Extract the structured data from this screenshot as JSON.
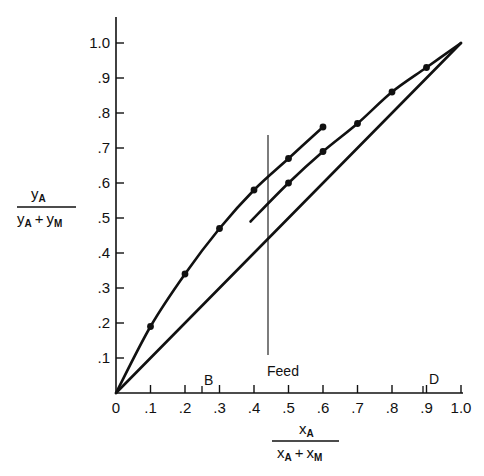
{
  "chart_data": {
    "type": "line",
    "title": "",
    "xlabel": "x_A / (x_A + x_M)",
    "ylabel": "y_A / (y_A + y_M)",
    "xlim": [
      0,
      1.0
    ],
    "ylim": [
      0,
      1.0
    ],
    "grid": false,
    "x_ticks": [
      "0",
      ".1",
      ".2",
      ".3",
      ".4",
      ".5",
      ".6",
      ".7",
      ".8",
      ".9",
      "1.0"
    ],
    "y_ticks": [
      ".1",
      ".2",
      ".3",
      ".4",
      ".5",
      ".6",
      ".7",
      ".8",
      ".9",
      "1.0"
    ],
    "series": [
      {
        "name": "Enriching section equilibrium points (upper curve)",
        "x": [
          0.0,
          0.1,
          0.2,
          0.3,
          0.4,
          0.5,
          0.6
        ],
        "y": [
          0.0,
          0.19,
          0.34,
          0.47,
          0.58,
          0.67,
          0.76
        ],
        "markers": true
      },
      {
        "name": "Stripping section curve (lower curve)",
        "x": [
          0.39,
          0.5,
          0.6,
          0.7,
          0.8,
          0.9,
          1.0
        ],
        "y": [
          0.49,
          0.6,
          0.69,
          0.77,
          0.86,
          0.93,
          1.0
        ],
        "markers": true
      },
      {
        "name": "Diagonal y = x",
        "x": [
          0.0,
          1.0
        ],
        "y": [
          0.0,
          1.0
        ],
        "markers": false
      }
    ],
    "annotations": [
      {
        "text": "Feed",
        "x": 0.44,
        "type": "vertical-line"
      },
      {
        "text": "B",
        "x": 0.25,
        "type": "axis-tick"
      },
      {
        "text": "D",
        "x": 0.89,
        "type": "axis-tick"
      }
    ]
  },
  "labels": {
    "y_num": "y",
    "y_num_sub": "A",
    "y_den_a": "y",
    "y_den_a_sub": "A",
    "y_den_plus": "+",
    "y_den_b": "y",
    "y_den_b_sub": "M",
    "x_num": "x",
    "x_num_sub": "A",
    "x_den_a": "x",
    "x_den_a_sub": "A",
    "x_den_plus": "+",
    "x_den_b": "x",
    "x_den_b_sub": "M",
    "feed": "Feed",
    "b_mark": "B",
    "d_mark": "D"
  },
  "colors": {
    "ink": "#111111",
    "background": "#ffffff"
  }
}
